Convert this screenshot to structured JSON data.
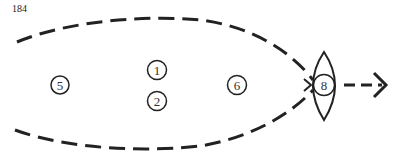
{
  "page": {
    "number": "184"
  },
  "diagram": {
    "nodes": [
      {
        "id": "5",
        "label": "5",
        "cx": 60,
        "cy": 85
      },
      {
        "id": "1",
        "label": "1",
        "cx": 157,
        "cy": 70
      },
      {
        "id": "2",
        "label": "2",
        "cx": 157,
        "cy": 101
      },
      {
        "id": "6",
        "label": "6",
        "cx": 237,
        "cy": 85
      },
      {
        "id": "8",
        "label": "8",
        "cx": 324,
        "cy": 85
      }
    ],
    "colors": {
      "stroke": "#222222",
      "background": "#ffffff"
    }
  }
}
